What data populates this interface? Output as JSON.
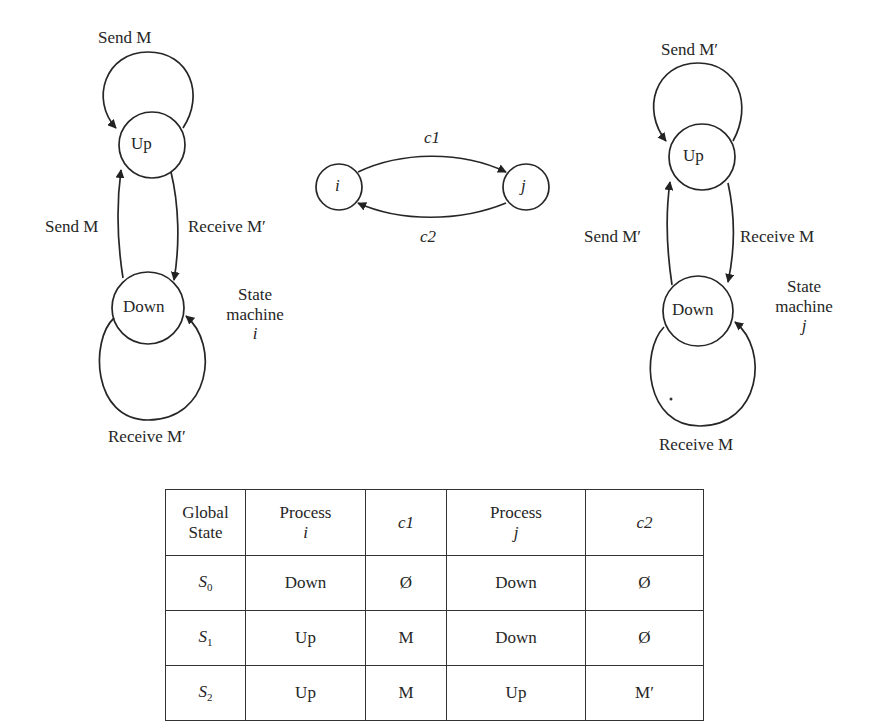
{
  "machine_i": {
    "states": [
      "Up",
      "Down"
    ],
    "top_loop_label": "Send M",
    "left_edge_label": "Send M",
    "right_edge_label": "Receive M′",
    "bottom_loop_label": "Receive M′",
    "caption_line1": "State",
    "caption_line2": "machine",
    "caption_var": "i"
  },
  "channels": {
    "node_i": "i",
    "node_j": "j",
    "top_channel": "c1",
    "bottom_channel": "c2"
  },
  "machine_j": {
    "states": [
      "Up",
      "Down"
    ],
    "top_loop_label": "Send M′",
    "left_edge_label": "Send M′",
    "right_edge_label": "Receive M",
    "bottom_loop_label": "Receive M",
    "caption_line1": "State",
    "caption_line2": "machine",
    "caption_var": "j"
  },
  "table": {
    "headers": [
      {
        "line1": "Global",
        "line2": "State"
      },
      {
        "line1": "Process",
        "line2": "i"
      },
      {
        "line1": "c1",
        "line2": ""
      },
      {
        "line1": "Process",
        "line2": "j"
      },
      {
        "line1": "c2",
        "line2": ""
      }
    ],
    "rows": [
      {
        "state": "S",
        "sub": "0",
        "process_i": "Down",
        "c1": "Ø",
        "process_j": "Down",
        "c2": "Ø"
      },
      {
        "state": "S",
        "sub": "1",
        "process_i": "Up",
        "c1": "M",
        "process_j": "Down",
        "c2": "Ø"
      },
      {
        "state": "S",
        "sub": "2",
        "process_i": "Up",
        "c1": "M",
        "process_j": "Up",
        "c2": "M′"
      }
    ]
  }
}
